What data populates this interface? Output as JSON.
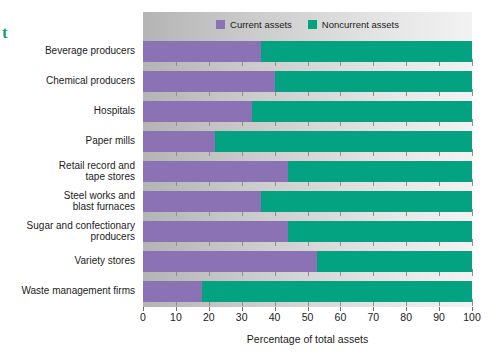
{
  "edge_glyph": "t",
  "chart_data": {
    "type": "bar",
    "orientation": "horizontal",
    "stacked": true,
    "title": "",
    "xlabel": "Percentage of total assets",
    "ylabel": "",
    "xlim": [
      0,
      100
    ],
    "xticks": [
      0,
      10,
      20,
      30,
      40,
      50,
      60,
      70,
      80,
      90,
      100
    ],
    "xtick_labels": [
      "0",
      "10",
      "20",
      "30",
      "40",
      "50",
      "60",
      "70",
      "80",
      "90",
      "100"
    ],
    "grid": false,
    "legend_position": "top-center",
    "categories": [
      "Beverage producers",
      "Chemical producers",
      "Hospitals",
      "Paper mills",
      "Retail record and\ntape stores",
      "Steel works and\nblast furnaces",
      "Sugar and confectionary\nproducers",
      "Variety stores",
      "Waste management firms"
    ],
    "series": [
      {
        "name": "Current assets",
        "color": "#8a72b4",
        "values": [
          36,
          40,
          33,
          22,
          44,
          36,
          44,
          53,
          18
        ]
      },
      {
        "name": "Noncurrent assets",
        "color": "#03a382",
        "values": [
          64,
          60,
          67,
          78,
          56,
          64,
          56,
          47,
          82
        ]
      }
    ]
  },
  "legend": {
    "items": [
      {
        "label": "Current assets",
        "color": "#8a72b4"
      },
      {
        "label": "Noncurrent assets",
        "color": "#03a382"
      }
    ]
  },
  "colors": {
    "current_assets": "#8a72b4",
    "noncurrent_assets": "#03a382",
    "plot_background": "#d5d5d5",
    "tick": "#6f6f6f"
  }
}
